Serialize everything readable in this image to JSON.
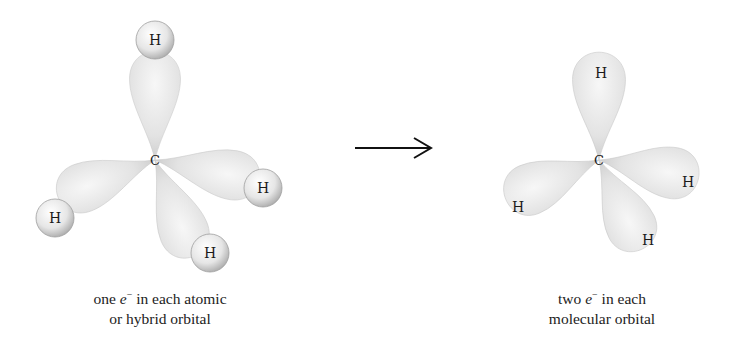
{
  "figure": {
    "type": "orbital-diagram",
    "transition_arrow": "→",
    "left_panel": {
      "name": "atomic-or-hybrid-orbitals",
      "central_atom": "C",
      "bonded_atoms": [
        "H",
        "H",
        "H",
        "H"
      ],
      "caption": {
        "line1_prefix": "one ",
        "electron_symbol": "e",
        "electron_charge": "−",
        "line1_suffix": " in each atomic",
        "line2": "or hybrid orbital"
      }
    },
    "right_panel": {
      "name": "molecular-orbitals",
      "central_atom": "C",
      "bonded_atoms": [
        "H",
        "H",
        "H",
        "H"
      ],
      "caption": {
        "line1_prefix": "two ",
        "electron_symbol": "e",
        "electron_charge": "−",
        "line1_suffix": " in each",
        "line2": "molecular orbital"
      }
    },
    "colors": {
      "lobe_light": "#f4f4f4",
      "lobe_mid": "#dcdcdc",
      "lobe_edge": "#bdbdbd",
      "sphere_light": "#fafafa",
      "sphere_edge": "#a9a9a9",
      "text": "#1a1a1a",
      "arrow": "#111111"
    }
  }
}
